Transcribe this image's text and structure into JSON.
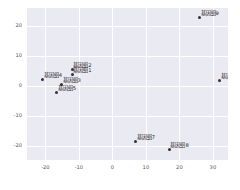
{
  "chart_data": {
    "type": "scatter",
    "title": "",
    "xlabel": "",
    "ylabel": "",
    "xlim": [
      -25.5,
      34.5
    ],
    "ylim": [
      -24.5,
      26.0
    ],
    "xticks": [
      -20,
      -10,
      0,
      10,
      20,
      30
    ],
    "xticklabels": [
      "-20",
      "-10",
      "0",
      "10",
      "20",
      "30"
    ],
    "yticks": [
      -20,
      -10,
      0,
      10,
      20
    ],
    "yticklabels": [
      "-20",
      "-10",
      "0",
      "10",
      "20"
    ],
    "grid": true,
    "legend": "none",
    "style": "seaborn-darkgrid",
    "axes_facecolor": "#eaeaf2",
    "figure_facecolor": "#ffffff",
    "gridline_color": "#ffffff",
    "marker_color": "#31313a",
    "label_color": "#1a1a1a",
    "tick_color": "#555555",
    "points": [
      {
        "label": "基因组1",
        "x": -12.0,
        "y": 4.0
      },
      {
        "label": "基因组2",
        "x": -12.0,
        "y": 5.6
      },
      {
        "label": "基因组3",
        "x": -15.2,
        "y": 0.6
      },
      {
        "label": "基因组4",
        "x": -20.8,
        "y": 2.4
      },
      {
        "label": "基因组5",
        "x": -16.6,
        "y": -2.0
      },
      {
        "label": "基因组6",
        "x": 32.0,
        "y": 2.0
      },
      {
        "label": "基因组7",
        "x": 7.0,
        "y": -18.2
      },
      {
        "label": "基因组8",
        "x": 17.0,
        "y": -21.0
      },
      {
        "label": "基因组9",
        "x": 26.0,
        "y": 23.0
      }
    ]
  }
}
